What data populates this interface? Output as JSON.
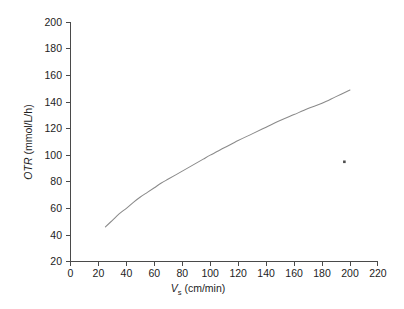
{
  "chart_data": {
    "type": "line",
    "title": "",
    "subtitle": "",
    "xlabel": "V_s (cm/min)",
    "ylabel": "OTR (mmol/L/h)",
    "xlabel_parts": {
      "symbol": "V",
      "subscript": "s",
      "units": "(cm/min)"
    },
    "ylabel_parts": {
      "symbol": "OTR",
      "units": "(mmol/L/h)"
    },
    "xlim": [
      0,
      220
    ],
    "ylim": [
      20,
      200
    ],
    "xticks": [
      0,
      20,
      40,
      60,
      80,
      100,
      120,
      140,
      160,
      180,
      200,
      220
    ],
    "yticks": [
      20,
      40,
      60,
      80,
      100,
      120,
      140,
      160,
      180,
      200
    ],
    "xtick_labels": [
      "0",
      "20",
      "40",
      "60",
      "80",
      "100",
      "120",
      "140",
      "160",
      "180",
      "200",
      "220"
    ],
    "ytick_labels": [
      "20",
      "40",
      "60",
      "80",
      "100",
      "120",
      "140",
      "160",
      "180",
      "200"
    ],
    "grid": false,
    "legend": false,
    "legend_position": "none",
    "spines": [
      "left",
      "bottom"
    ],
    "tick_direction": "out",
    "series": [
      {
        "name": "OTR",
        "color": "#8a8a8a",
        "style": "solid",
        "x": [
          25,
          30,
          35,
          40,
          45,
          50,
          55,
          60,
          65,
          70,
          75,
          80,
          85,
          90,
          95,
          100,
          110,
          120,
          130,
          140,
          150,
          160,
          170,
          180,
          190,
          200
        ],
        "y": [
          46,
          51,
          56,
          60,
          64.5,
          68.5,
          72,
          75.5,
          79,
          82,
          85,
          88,
          91,
          94,
          97,
          100,
          105.5,
          111,
          116,
          121,
          126,
          130.5,
          135,
          139,
          144,
          149
        ]
      }
    ],
    "annotations": [
      {
        "name": "scan-speck",
        "x": 196,
        "y": 95,
        "kind": "artifact"
      }
    ]
  },
  "figure": {
    "background": "#ffffff",
    "axis_color": "#4a4a4a",
    "text_color": "#1d1d1d",
    "curve_color": "#8a8a8a"
  }
}
